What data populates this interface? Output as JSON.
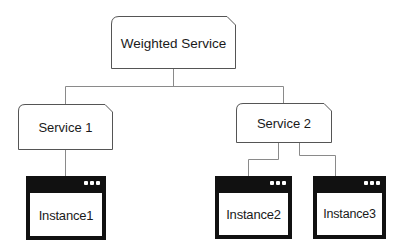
{
  "diagram": {
    "type": "tree",
    "root": {
      "label": "Weighted Service",
      "shape": "clipped-corner-box"
    },
    "services": [
      {
        "label": "Service 1",
        "children": [
          "Instance1"
        ]
      },
      {
        "label": "Service 2",
        "children": [
          "Instance2",
          "Instance3"
        ]
      }
    ],
    "instances": [
      {
        "label": "Instance1",
        "icon": "window-icon"
      },
      {
        "label": "Instance2",
        "icon": "window-icon"
      },
      {
        "label": "Instance3",
        "icon": "window-icon"
      }
    ],
    "edges": [
      {
        "from": "Weighted Service",
        "to": "Service 1"
      },
      {
        "from": "Weighted Service",
        "to": "Service 2"
      },
      {
        "from": "Service 1",
        "to": "Instance1"
      },
      {
        "from": "Service 2",
        "to": "Instance2"
      },
      {
        "from": "Service 2",
        "to": "Instance3"
      }
    ],
    "colors": {
      "box_border": "#555555",
      "connector": "#8a8a8a",
      "instance_frame": "#111111",
      "background": "#ffffff",
      "text": "#1a1a1a"
    }
  }
}
